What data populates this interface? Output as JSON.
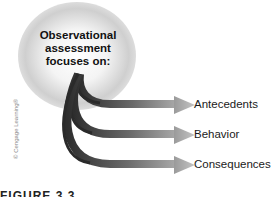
{
  "diagram": {
    "title_lines": [
      "Observational",
      "assessment",
      "focuses on:"
    ],
    "items": [
      {
        "label": "Antecedents"
      },
      {
        "label": "Behavior"
      },
      {
        "label": "Consequences"
      }
    ],
    "credit": "© Cengage Learning®",
    "figure_label": "FIGURE 3.3",
    "colors": {
      "arrow_dark": "#3a3a3a",
      "arrow_light": "#b8b8b8",
      "glow": "#c8c8c8"
    }
  }
}
